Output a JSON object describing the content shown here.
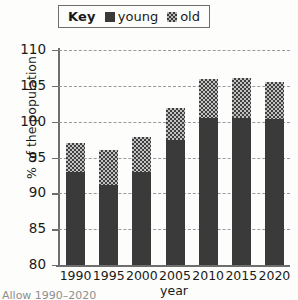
{
  "legend": {
    "title": "Key",
    "entries": [
      {
        "label": "young",
        "swatch": "solid-dark-square-icon",
        "color": "#3a3a3a"
      },
      {
        "label": "old",
        "swatch": "checkered-square-icon",
        "color": "#b9b9b9"
      }
    ]
  },
  "axes": {
    "ylabel": "% of the population",
    "xlabel": "year",
    "yticks": [
      "110",
      "105",
      "100",
      "95",
      "90",
      "85",
      "80"
    ]
  },
  "caption": "Allow 1990–2020",
  "chart_data": {
    "type": "bar",
    "title": "",
    "subtitle": "",
    "stacked": true,
    "xlabel": "year",
    "ylabel": "% of the population",
    "ylim": [
      80,
      110
    ],
    "ytick_step": 5,
    "yticks": [
      80,
      85,
      90,
      95,
      100,
      105,
      110
    ],
    "grid": true,
    "grid_style": "dashed-horizontal",
    "legend_position": "top-center",
    "categories": [
      "1990",
      "1995",
      "2000",
      "2005",
      "2010",
      "2015",
      "2020"
    ],
    "series": [
      {
        "name": "young",
        "color": "#3a3a3a",
        "pattern": "solid",
        "values": [
          93.0,
          91.2,
          93.0,
          97.5,
          100.5,
          100.5,
          100.4
        ]
      },
      {
        "name": "old",
        "color": "#b9b9b9",
        "pattern": "checkered",
        "values": [
          4.0,
          4.8,
          4.8,
          4.4,
          5.5,
          5.6,
          5.2
        ]
      }
    ],
    "totals": [
      97.0,
      96.0,
      97.8,
      101.9,
      106.0,
      106.1,
      105.6
    ]
  }
}
